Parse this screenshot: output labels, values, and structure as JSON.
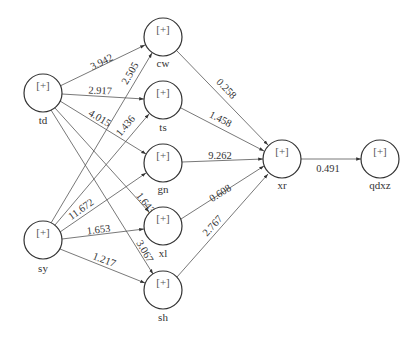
{
  "diagram": {
    "type": "neural-network",
    "node_glyph": "[+]",
    "colors": {
      "stroke": "#333333",
      "edge": "#555555",
      "background": "#ffffff"
    },
    "nodes": [
      {
        "id": "td",
        "label": "td",
        "x": 43,
        "y": 93
      },
      {
        "id": "sy",
        "label": "sy",
        "x": 43,
        "y": 240
      },
      {
        "id": "cw",
        "label": "cw",
        "x": 163,
        "y": 37
      },
      {
        "id": "ts",
        "label": "ts",
        "x": 163,
        "y": 100
      },
      {
        "id": "gn",
        "label": "gn",
        "x": 163,
        "y": 163
      },
      {
        "id": "xl",
        "label": "xl",
        "x": 163,
        "y": 226
      },
      {
        "id": "sh",
        "label": "sh",
        "x": 163,
        "y": 290
      },
      {
        "id": "xr",
        "label": "xr",
        "x": 282,
        "y": 159
      },
      {
        "id": "qdxz",
        "label": "qdxz",
        "x": 380,
        "y": 159
      }
    ],
    "edges": [
      {
        "from": "td",
        "to": "cw",
        "weight": "3.942"
      },
      {
        "from": "td",
        "to": "ts",
        "weight": "2.917"
      },
      {
        "from": "td",
        "to": "gn",
        "weight": "4.015"
      },
      {
        "from": "td",
        "to": "xl",
        "weight": "1.643"
      },
      {
        "from": "td",
        "to": "sh",
        "weight": "3.067"
      },
      {
        "from": "sy",
        "to": "cw",
        "weight": "2.505"
      },
      {
        "from": "sy",
        "to": "ts",
        "weight": "1.436"
      },
      {
        "from": "sy",
        "to": "gn",
        "weight": "11.672"
      },
      {
        "from": "sy",
        "to": "xl",
        "weight": "1.653"
      },
      {
        "from": "sy",
        "to": "sh",
        "weight": "1.217"
      },
      {
        "from": "cw",
        "to": "xr",
        "weight": "0.258"
      },
      {
        "from": "ts",
        "to": "xr",
        "weight": "1.458"
      },
      {
        "from": "gn",
        "to": "xr",
        "weight": "9.262"
      },
      {
        "from": "xl",
        "to": "xr",
        "weight": "0.608"
      },
      {
        "from": "sh",
        "to": "xr",
        "weight": "2.767"
      },
      {
        "from": "xr",
        "to": "qdxz",
        "weight": "0.491"
      }
    ],
    "weight_labels": {
      "td_cw": "3.942",
      "td_ts": "2.917",
      "td_gn": "4.015",
      "td_xl": "1.643",
      "td_sh": "3.067",
      "sy_cw": "2.505",
      "sy_ts": "1.436",
      "sy_gn": "11.672",
      "sy_xl": "1.653",
      "sy_sh": "1.217",
      "cw_xr": "0.258",
      "ts_xr": "1.458",
      "gn_xr": "9.262",
      "xl_xr": "0.608",
      "sh_xr": "2.767",
      "xr_qdxz": "0.491"
    },
    "node_labels": {
      "td": "td",
      "sy": "sy",
      "cw": "cw",
      "ts": "ts",
      "gn": "gn",
      "xl": "xl",
      "sh": "sh",
      "xr": "xr",
      "qdxz": "qdxz"
    }
  }
}
